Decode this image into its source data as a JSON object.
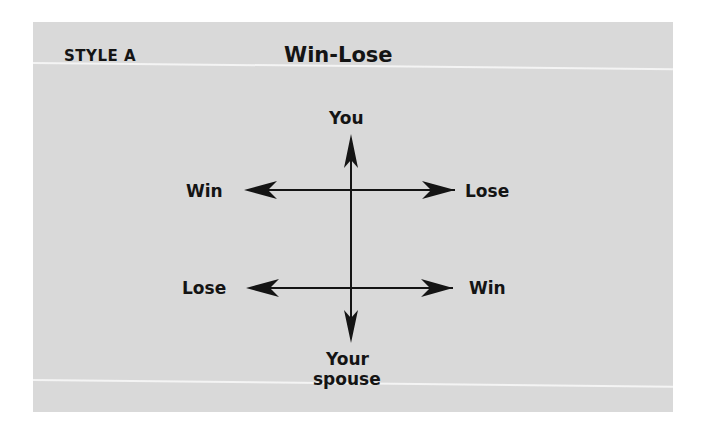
{
  "header": {
    "style_label": "STYLE A",
    "title": "Win-Lose"
  },
  "diagram": {
    "top_label": "You",
    "bottom_label_line1": "Your",
    "bottom_label_line2": "spouse",
    "upper_row": {
      "left": "Win",
      "right": "Lose"
    },
    "lower_row": {
      "left": "Lose",
      "right": "Win"
    }
  },
  "colors": {
    "panel": "#d9d9d9",
    "ink": "#141414",
    "rule": "#f4f4f4"
  }
}
